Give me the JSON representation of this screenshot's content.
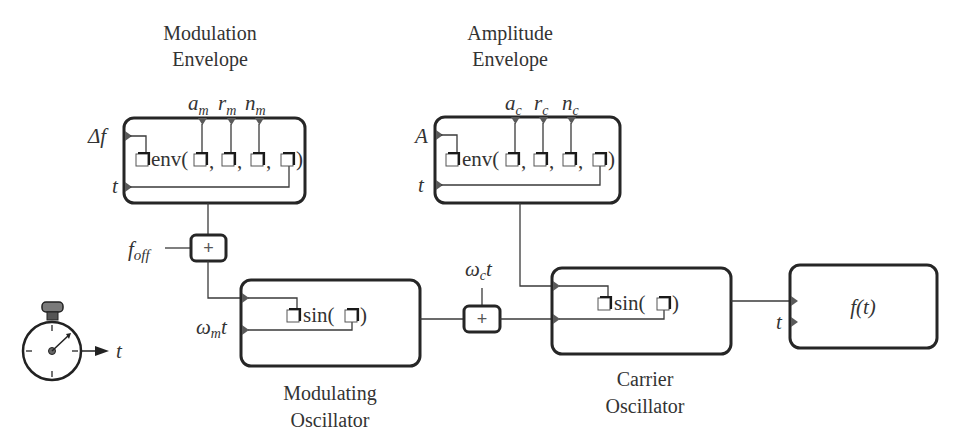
{
  "blocks": {
    "modulation_envelope": {
      "title_line1": "Modulation",
      "title_line2": "Envelope",
      "function": "env(",
      "sep1": ",",
      "sep2": ",",
      "sep3": ",",
      "close": ")",
      "inputs": {
        "left_top": "Δf",
        "left_bottom": "t"
      },
      "params": [
        {
          "base": "a",
          "sub": "m"
        },
        {
          "base": "r",
          "sub": "m"
        },
        {
          "base": "n",
          "sub": "m"
        }
      ]
    },
    "amplitude_envelope": {
      "title_line1": "Amplitude",
      "title_line2": "Envelope",
      "function": "env(",
      "sep1": ",",
      "sep2": ",",
      "sep3": ",",
      "close": ")",
      "inputs": {
        "left_top": "A",
        "left_bottom": "t"
      },
      "params": [
        {
          "base": "a",
          "sub": "c"
        },
        {
          "base": "r",
          "sub": "c"
        },
        {
          "base": "n",
          "sub": "c"
        }
      ]
    },
    "offset_adder": {
      "symbol": "+",
      "input_label_base": "f",
      "input_label_sub": "off"
    },
    "modulating_oscillator": {
      "title_line1": "Modulating",
      "title_line2": "Oscillator",
      "function": "sin(",
      "close": ")",
      "input_label_base": "ω",
      "input_label_sub": "m",
      "input_label_tail": "t"
    },
    "carrier_adder": {
      "symbol": "+",
      "input_label_base": "ω",
      "input_label_sub": "c",
      "input_label_tail": "t"
    },
    "carrier_oscillator": {
      "title_line1": "Carrier",
      "title_line2": "Oscillator",
      "function": "sin(",
      "close": ")"
    },
    "output": {
      "label": "f(t)",
      "input_t": "t"
    },
    "clock": {
      "icon": "stopwatch-icon",
      "output_label": "t"
    }
  },
  "colors": {
    "stroke": "#262626",
    "port": "#5a5a5a",
    "text": "#333333"
  }
}
